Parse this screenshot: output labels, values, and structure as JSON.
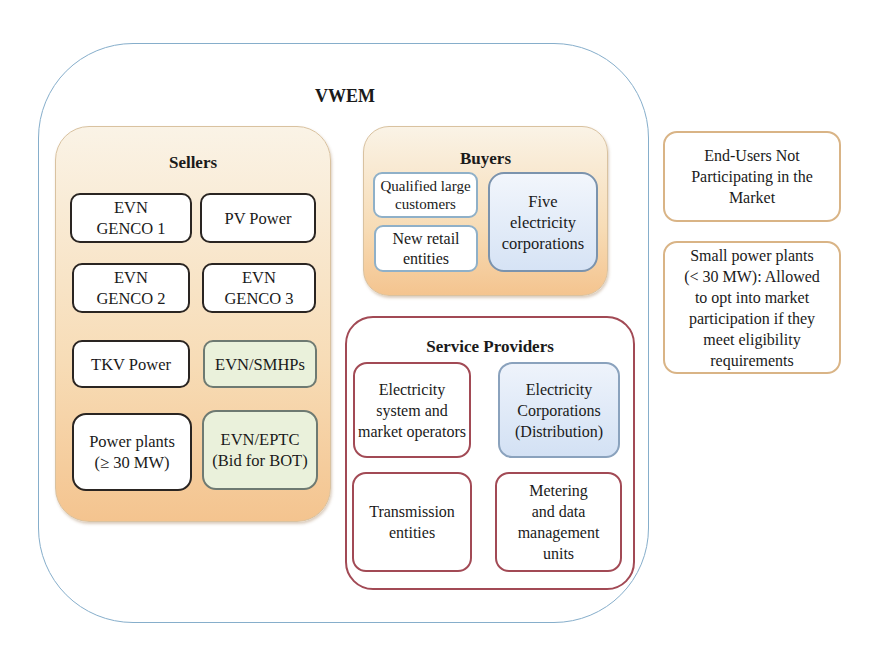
{
  "diagram": {
    "title": "VWEM",
    "sellers": {
      "title": "Sellers",
      "items": [
        {
          "label": "EVN\nGENCO 1",
          "style": "white"
        },
        {
          "label": "PV Power",
          "style": "white"
        },
        {
          "label": "EVN\nGENCO 2",
          "style": "white"
        },
        {
          "label": "EVN\nGENCO 3",
          "style": "white"
        },
        {
          "label": "TKV Power",
          "style": "white"
        },
        {
          "label": "EVN/SMHPs",
          "style": "green"
        },
        {
          "label": "Power plants\n(≥ 30 MW)",
          "style": "white"
        },
        {
          "label": "EVN/EPTC\n(Bid for BOT)",
          "style": "green"
        }
      ]
    },
    "buyers": {
      "title": "Buyers",
      "items": [
        {
          "label": "Qualified large\ncustomers"
        },
        {
          "label": "New retail\nentities"
        },
        {
          "label": "Five\nelectricity\ncorporations"
        }
      ]
    },
    "service_providers": {
      "title": "Service Providers",
      "items": [
        {
          "label": "Electricity\nsystem and\nmarket operators"
        },
        {
          "label": "Electricity\nCorporations\n(Distribution)"
        },
        {
          "label": "Transmission\nentities"
        },
        {
          "label": "Metering\nand data\nmanagement\nunits"
        }
      ]
    },
    "outside": [
      {
        "label": "End-Users Not\nParticipating in the\nMarket"
      },
      {
        "label": "Small power plants\n(< 30 MW): Allowed\nto opt into market\nparticipation if they\nmeet eligibility\nrequirements"
      }
    ],
    "colors": {
      "outer_border": "#86aecb",
      "group_orange_top": "#faf3e6",
      "group_orange_bottom": "#f4c48f",
      "service_border": "#a24a55",
      "green_box": "#eaf1db",
      "blue_box": "#d6e3f5",
      "tan_border": "#d9b486"
    }
  }
}
